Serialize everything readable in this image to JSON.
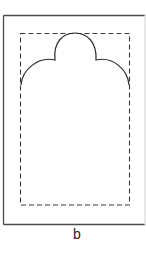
{
  "figure": {
    "label": "b",
    "colors": {
      "stroke": "#2a2a2a",
      "frame_right": "#c8c8c8",
      "background": "#ffffff"
    }
  }
}
